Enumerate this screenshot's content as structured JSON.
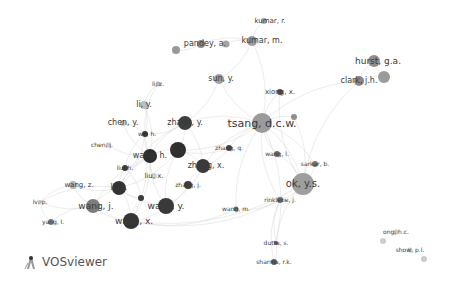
{
  "app": {
    "name": "VOSviewer"
  },
  "network": {
    "type": "co-authorship",
    "nodes": [
      {
        "id": "kumar_r",
        "label": "kumar, r.",
        "x": 264,
        "y": 21,
        "r": 3,
        "shade": "#a8a8a8",
        "font": 7
      },
      {
        "id": "kumar_m",
        "label": "kumar, m.",
        "x": 252,
        "y": 41,
        "r": 5,
        "shade": "#9a9a9a",
        "font": 8
      },
      {
        "id": "pandey_a",
        "label": "pandey, a.",
        "x": 201,
        "y": 44,
        "r": 4,
        "shade": "#8d8d8d",
        "font": 8
      },
      {
        "id": "pandey_extra1",
        "label": "",
        "x": 176,
        "y": 50,
        "r": 4,
        "shade": "#999999",
        "font": 0
      },
      {
        "id": "pandey_extra2",
        "label": "",
        "x": 226,
        "y": 44,
        "r": 3.5,
        "shade": "#a5a5a5",
        "font": 0
      },
      {
        "id": "hurst_ga",
        "label": "hurst, g.a.",
        "x": 374,
        "y": 61,
        "r": 6,
        "shade": "#8e8e8e",
        "font": 9
      },
      {
        "id": "clark_jh",
        "label": "clark, j.h.",
        "x": 359,
        "y": 81,
        "r": 5,
        "shade": "#888888",
        "font": 8
      },
      {
        "id": "clark_extra",
        "label": "",
        "x": 384,
        "y": 77,
        "r": 6,
        "shade": "#9b9b9b",
        "font": 0
      },
      {
        "id": "sun_y",
        "label": "sun, y.",
        "x": 219,
        "y": 79,
        "r": 5,
        "shade": "#a0a0a0",
        "font": 8
      },
      {
        "id": "li_z",
        "label": "li, z.",
        "x": 158,
        "y": 84,
        "r": 2.5,
        "shade": "#b5b5b5",
        "font": 6
      },
      {
        "id": "xiong_x",
        "label": "xiong, x.",
        "x": 280,
        "y": 92,
        "r": 3,
        "shade": "#4d4d4d",
        "font": 7
      },
      {
        "id": "li_y",
        "label": "li, y.",
        "x": 144,
        "y": 105,
        "r": 4,
        "shade": "#bcbcbc",
        "font": 8
      },
      {
        "id": "extra_xiong",
        "label": "",
        "x": 294,
        "y": 117,
        "r": 3,
        "shade": "#8f8f8f",
        "font": 0
      },
      {
        "id": "tsang_dcw",
        "label": "tsang, d.c.w.",
        "x": 262,
        "y": 123,
        "r": 10,
        "shade": "#9b9b9b",
        "font": 11
      },
      {
        "id": "chen_y",
        "label": "chen, y.",
        "x": 123,
        "y": 123,
        "r": 3,
        "shade": "#c4c4c4",
        "font": 8
      },
      {
        "id": "zhang_y",
        "label": "zhang, y.",
        "x": 185,
        "y": 123,
        "r": 7,
        "shade": "#3e3e3e",
        "font": 8
      },
      {
        "id": "wu_h",
        "label": "wu, h.",
        "x": 145,
        "y": 134,
        "r": 3,
        "shade": "#333333",
        "font": 6
      },
      {
        "id": "chen_j",
        "label": "chen, j.",
        "x": 108,
        "y": 145,
        "r": 2.5,
        "shade": "#c8c8c8",
        "font": 6
      },
      {
        "id": "li_j",
        "label": "li, j.",
        "x": 178,
        "y": 150,
        "r": 8,
        "shade": "#2f2f2f",
        "font": 8
      },
      {
        "id": "zhang_q",
        "label": "zhang, q.",
        "x": 229,
        "y": 148,
        "r": 3,
        "shade": "#444444",
        "font": 6
      },
      {
        "id": "wang_h",
        "label": "wang, h.",
        "x": 150,
        "y": 156,
        "r": 7,
        "shade": "#2d2d2d",
        "font": 8
      },
      {
        "id": "wang_l",
        "label": "wang, l.",
        "x": 277,
        "y": 154,
        "r": 3,
        "shade": "#6a6a6a",
        "font": 6
      },
      {
        "id": "zhang_x",
        "label": "zhang, x.",
        "x": 203,
        "y": 166,
        "r": 7,
        "shade": "#3a3a3a",
        "font": 8
      },
      {
        "id": "sarkar_b",
        "label": "sarkar, b.",
        "x": 315,
        "y": 164,
        "r": 3,
        "shade": "#777777",
        "font": 6
      },
      {
        "id": "liu_h",
        "label": "liu, h.",
        "x": 125,
        "y": 168,
        "r": 3,
        "shade": "#3b3b3b",
        "font": 6
      },
      {
        "id": "liu_x",
        "label": "liu, x.",
        "x": 154,
        "y": 176,
        "r": 3,
        "shade": "#cfcfcf",
        "font": 7
      },
      {
        "id": "ok_ys",
        "label": "ok, y.s.",
        "x": 303,
        "y": 184,
        "r": 11,
        "shade": "#9e9e9e",
        "font": 10
      },
      {
        "id": "zhang_j",
        "label": "zhang, j.",
        "x": 188,
        "y": 185,
        "r": 4,
        "shade": "#3f3f3f",
        "font": 6
      },
      {
        "id": "wang_z",
        "label": "wang, z.",
        "x": 73,
        "y": 185,
        "r": 4,
        "shade": "#b5b5b5",
        "font": 7
      },
      {
        "id": "li_x",
        "label": "li, x.",
        "x": 119,
        "y": 188,
        "r": 7,
        "shade": "#333333",
        "font": 8
      },
      {
        "id": "small_dark",
        "label": "",
        "x": 141,
        "y": 198,
        "r": 3,
        "shade": "#3a3a3a",
        "font": 0
      },
      {
        "id": "rinklebe_j",
        "label": "rinklebe, j.",
        "x": 280,
        "y": 200,
        "r": 3,
        "shade": "#6f6f6f",
        "font": 6
      },
      {
        "id": "lv_p",
        "label": "lv, p.",
        "x": 40,
        "y": 202,
        "r": 2,
        "shade": "#bbbbbb",
        "font": 6
      },
      {
        "id": "wang_j",
        "label": "wang, j.",
        "x": 93,
        "y": 206,
        "r": 7,
        "shade": "#7d7d7d",
        "font": 9
      },
      {
        "id": "wang_y",
        "label": "wang, y.",
        "x": 166,
        "y": 206,
        "r": 8,
        "shade": "#3a3a3a",
        "font": 9
      },
      {
        "id": "wang_m",
        "label": "wang, m.",
        "x": 236,
        "y": 209,
        "r": 2.5,
        "shade": "#6e6e6e",
        "font": 6
      },
      {
        "id": "yang_l",
        "label": "yang, l.",
        "x": 51,
        "y": 222,
        "r": 3,
        "shade": "#7a7a7a",
        "font": 6
      },
      {
        "id": "wang_x",
        "label": "wang, x.",
        "x": 131,
        "y": 221,
        "r": 8,
        "shade": "#353535",
        "font": 9
      },
      {
        "id": "ong_hc",
        "label": "ong, h.c.",
        "x": 396,
        "y": 232,
        "r": 2.5,
        "shade": "#c6c6c6",
        "font": 6
      },
      {
        "id": "ong_extra",
        "label": "",
        "x": 383,
        "y": 241,
        "r": 3,
        "shade": "#cdcdcd",
        "font": 0
      },
      {
        "id": "dutta_s",
        "label": "dutta, s.",
        "x": 276,
        "y": 243,
        "r": 2,
        "shade": "#5a5a5a",
        "font": 6
      },
      {
        "id": "show_pl",
        "label": "show, p.l.",
        "x": 410,
        "y": 250,
        "r": 2.5,
        "shade": "#cdcdcd",
        "font": 6
      },
      {
        "id": "show_extra",
        "label": "",
        "x": 424,
        "y": 259,
        "r": 3,
        "shade": "#cbcbcb",
        "font": 0
      },
      {
        "id": "sharma_rk",
        "label": "sharma, r.k.",
        "x": 274,
        "y": 262,
        "r": 3,
        "shade": "#5c5c5c",
        "font": 6
      }
    ],
    "label_offsets": {
      "kumar_r": [
        6,
        0
      ],
      "kumar_m": [
        10,
        0
      ],
      "pandey_a": [
        4,
        0
      ],
      "hurst_ga": [
        4,
        0
      ],
      "clark_jh": [
        0,
        0
      ],
      "sun_y": [
        2,
        0
      ],
      "li_z": [
        0,
        0
      ],
      "xiong_x": [
        0,
        0
      ],
      "li_y": [
        0,
        0
      ],
      "tsang_dcw": [
        0,
        0
      ],
      "chen_y": [
        0,
        0
      ],
      "zhang_y": [
        0,
        0
      ],
      "wu_h": [
        2,
        0
      ],
      "chen_j": [
        -6,
        0
      ],
      "li_j": [
        0,
        0
      ],
      "zhang_q": [
        0,
        0
      ],
      "wang_h": [
        0,
        0
      ],
      "wang_l": [
        0,
        0
      ],
      "zhang_x": [
        3,
        0
      ],
      "sarkar_b": [
        0,
        0
      ],
      "liu_h": [
        0,
        0
      ],
      "liu_x": [
        0,
        0
      ],
      "ok_ys": [
        0,
        0
      ],
      "zhang_j": [
        0,
        0
      ],
      "wang_z": [
        6,
        0
      ],
      "li_x": [
        0,
        0
      ],
      "rinklebe_j": [
        0,
        0
      ],
      "lv_p": [
        0,
        0
      ],
      "wang_j": [
        3,
        0
      ],
      "wang_y": [
        0,
        0
      ],
      "wang_m": [
        0,
        0
      ],
      "yang_l": [
        2,
        0
      ],
      "wang_x": [
        3,
        0
      ],
      "ong_hc": [
        0,
        0
      ],
      "dutta_s": [
        0,
        0
      ],
      "show_pl": [
        0,
        0
      ],
      "sharma_rk": [
        0,
        0
      ]
    },
    "edges": [
      [
        "tsang_dcw",
        "ok_ys"
      ],
      [
        "tsang_dcw",
        "zhang_y"
      ],
      [
        "tsang_dcw",
        "li_j"
      ],
      [
        "tsang_dcw",
        "zhang_x"
      ],
      [
        "tsang_dcw",
        "xiong_x"
      ],
      [
        "tsang_dcw",
        "wang_l"
      ],
      [
        "tsang_dcw",
        "sarkar_b"
      ],
      [
        "tsang_dcw",
        "rinklebe_j"
      ],
      [
        "tsang_dcw",
        "sun_y"
      ],
      [
        "tsang_dcw",
        "kumar_m"
      ],
      [
        "tsang_dcw",
        "clark_jh"
      ],
      [
        "tsang_dcw",
        "zhang_q"
      ],
      [
        "tsang_dcw",
        "extra_xiong"
      ],
      [
        "tsang_dcw",
        "wang_m"
      ],
      [
        "tsang_dcw",
        "dutta_s"
      ],
      [
        "ok_ys",
        "sarkar_b"
      ],
      [
        "ok_ys",
        "rinklebe_j"
      ],
      [
        "ok_ys",
        "wang_l"
      ],
      [
        "ok_ys",
        "xiong_x"
      ],
      [
        "ok_ys",
        "dutta_s"
      ],
      [
        "ok_ys",
        "wang_x"
      ],
      [
        "ok_ys",
        "extra_xiong"
      ],
      [
        "ok_ys",
        "clark_jh"
      ],
      [
        "rinklebe_j",
        "dutta_s"
      ],
      [
        "dutta_s",
        "sharma_rk"
      ],
      [
        "rinklebe_j",
        "sharma_rk"
      ],
      [
        "kumar_m",
        "kumar_r"
      ],
      [
        "kumar_m",
        "pandey_a"
      ],
      [
        "pandey_a",
        "pandey_extra1"
      ],
      [
        "kumar_m",
        "pandey_extra2"
      ],
      [
        "kumar_m",
        "sun_y"
      ],
      [
        "hurst_ga",
        "clark_jh"
      ],
      [
        "clark_jh",
        "clark_extra"
      ],
      [
        "hurst_ga",
        "clark_extra"
      ],
      [
        "zhang_y",
        "li_j"
      ],
      [
        "zhang_y",
        "wang_h"
      ],
      [
        "zhang_y",
        "wu_h"
      ],
      [
        "zhang_y",
        "li_x"
      ],
      [
        "zhang_y",
        "zhang_x"
      ],
      [
        "li_j",
        "wang_h"
      ],
      [
        "li_j",
        "zhang_x"
      ],
      [
        "li_j",
        "wang_y"
      ],
      [
        "li_j",
        "li_x"
      ],
      [
        "li_j",
        "zhang_q"
      ],
      [
        "wang_h",
        "wu_h"
      ],
      [
        "wang_h",
        "li_x"
      ],
      [
        "wang_h",
        "liu_h"
      ],
      [
        "wang_h",
        "wang_y"
      ],
      [
        "wang_h",
        "wang_x"
      ],
      [
        "wang_h",
        "liu_x"
      ],
      [
        "wang_h",
        "chen_j"
      ],
      [
        "wang_h",
        "li_y"
      ],
      [
        "wang_h",
        "chen_y"
      ],
      [
        "wu_h",
        "li_y"
      ],
      [
        "wu_h",
        "li_z"
      ],
      [
        "wu_h",
        "chen_y"
      ],
      [
        "wu_h",
        "li_x"
      ],
      [
        "wu_h",
        "liu_h"
      ],
      [
        "wu_h",
        "wang_x"
      ],
      [
        "li_x",
        "wang_j"
      ],
      [
        "li_x",
        "wang_x"
      ],
      [
        "li_x",
        "wang_y"
      ],
      [
        "li_x",
        "liu_h"
      ],
      [
        "li_x",
        "small_dark"
      ],
      [
        "li_x",
        "wang_z"
      ],
      [
        "li_x",
        "lv_p"
      ],
      [
        "wang_j",
        "wang_z"
      ],
      [
        "wang_j",
        "yang_l"
      ],
      [
        "wang_j",
        "lv_p"
      ],
      [
        "wang_j",
        "wang_x"
      ],
      [
        "wang_j",
        "wang_h"
      ],
      [
        "wang_x",
        "wang_y"
      ],
      [
        "wang_x",
        "small_dark"
      ],
      [
        "wang_y",
        "zhang_x"
      ],
      [
        "wang_y",
        "small_dark"
      ],
      [
        "zhang_x",
        "zhang_j"
      ],
      [
        "zhang_j",
        "wang_y"
      ],
      [
        "zhang_x",
        "zhang_q"
      ],
      [
        "yang_l",
        "lv_p"
      ],
      [
        "wang_z",
        "lv_p"
      ],
      [
        "wang_m",
        "wang_x"
      ],
      [
        "wang_m",
        "rinklebe_j"
      ],
      [
        "sun_y",
        "zhang_y"
      ],
      [
        "li_z",
        "li_y"
      ],
      [
        "liu_h",
        "small_dark"
      ],
      [
        "wang_x",
        "rinklebe_j"
      ]
    ]
  }
}
